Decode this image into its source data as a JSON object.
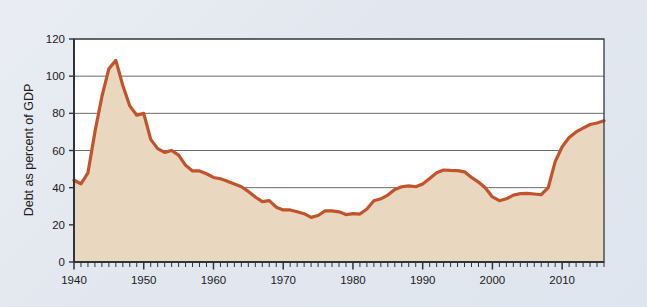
{
  "chart_data": {
    "type": "area",
    "title": "",
    "subtitle": "",
    "xlabel": "",
    "ylabel": "Debt as percent of GDP",
    "xlim": [
      1940,
      2016
    ],
    "ylim": [
      0,
      120
    ],
    "grid": "horizontal",
    "legend": "none",
    "x_major_ticks": [
      1940,
      1950,
      1960,
      1970,
      1980,
      1990,
      2000,
      2010
    ],
    "x_major_tick_labels": [
      "1940",
      "1950",
      "1960",
      "1970",
      "1980",
      "1990",
      "2000",
      "2010"
    ],
    "x_minor_tick_step": 1,
    "y_ticks": [
      0,
      20,
      40,
      60,
      80,
      100,
      120
    ],
    "y_tick_labels": [
      "0",
      "20",
      "40",
      "60",
      "80",
      "100",
      "120"
    ],
    "colors": {
      "line": "#c2532b",
      "fill": "#e9d7bf",
      "grid": "#6b6b6b",
      "axis": "#3c4650",
      "plot_background": "#ffffff",
      "figure_background": "#e4e9f0"
    },
    "series": [
      {
        "name": "Federal debt held by the public",
        "x": [
          1940,
          1941,
          1942,
          1943,
          1944,
          1945,
          1946,
          1947,
          1948,
          1949,
          1950,
          1951,
          1952,
          1953,
          1954,
          1955,
          1956,
          1957,
          1958,
          1959,
          1960,
          1961,
          1962,
          1963,
          1964,
          1965,
          1966,
          1967,
          1968,
          1969,
          1970,
          1971,
          1972,
          1973,
          1974,
          1975,
          1976,
          1977,
          1978,
          1979,
          1980,
          1981,
          1982,
          1983,
          1984,
          1985,
          1986,
          1987,
          1988,
          1989,
          1990,
          1991,
          1992,
          1993,
          1994,
          1995,
          1996,
          1997,
          1998,
          1999,
          2000,
          2001,
          2002,
          2003,
          2004,
          2005,
          2006,
          2007,
          2008,
          2009,
          2010,
          2011,
          2012,
          2013,
          2014,
          2015,
          2016
        ],
        "values": [
          44,
          42,
          48,
          70,
          89,
          104,
          108.5,
          95,
          84,
          79,
          80,
          66,
          61,
          59,
          60,
          57.5,
          52,
          49,
          49,
          47.5,
          45.5,
          44.8,
          43.5,
          42,
          40.5,
          38,
          35,
          32.5,
          33,
          29.5,
          28,
          28,
          27,
          26,
          24,
          25,
          27.5,
          27.5,
          27,
          25.5,
          26,
          25.8,
          28.5,
          33,
          34,
          36,
          39,
          40.5,
          41,
          40.5,
          42,
          45,
          48,
          49.5,
          49.3,
          49.2,
          48.5,
          45.5,
          43,
          39.8,
          35,
          33,
          34,
          36,
          36.8,
          36.9,
          36.6,
          36.2,
          40,
          54,
          62,
          67,
          70,
          72,
          74,
          74.8,
          76
        ],
        "units": "percent of GDP"
      }
    ],
    "annotations": []
  },
  "figure": {
    "alt_description": "Area chart of federal debt as a percent of GDP from 1940 to 2016"
  }
}
